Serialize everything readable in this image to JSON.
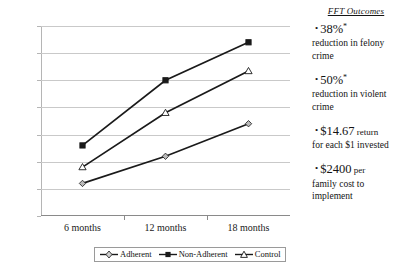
{
  "chart_data": {
    "type": "line",
    "title": "",
    "xlabel": "",
    "ylabel": "",
    "categories": [
      "6 months",
      "12 months",
      "18 months"
    ],
    "ylim": [
      0,
      35
    ],
    "ytick_labels": [
      "0.0%",
      "5.0%",
      "10.0%",
      "15.0%",
      "20.0%",
      "25.0%",
      "30.0%",
      "35.0%"
    ],
    "ytick_values": [
      0,
      5,
      10,
      15,
      20,
      25,
      30,
      35
    ],
    "grid": true,
    "legend_position": "bottom",
    "series": [
      {
        "name": "Adherent",
        "marker": "diamond",
        "values": [
          6.0,
          11.0,
          17.0
        ]
      },
      {
        "name": "Non-Adherent",
        "marker": "square",
        "values": [
          13.0,
          25.0,
          32.0
        ]
      },
      {
        "name": "Control",
        "marker": "triangle",
        "values": [
          9.0,
          19.0,
          26.7
        ]
      }
    ]
  },
  "legend": {
    "items": [
      {
        "label": "Adherent",
        "marker": "diamond-marker"
      },
      {
        "label": "Non-Adherent",
        "marker": "square-marker"
      },
      {
        "label": "Control",
        "marker": "triangle-marker"
      }
    ]
  },
  "outcomes": {
    "title": "FFT Outcomes",
    "items": [
      {
        "bullet": "•",
        "value": "38%",
        "sup": "*",
        "tail": "",
        "body": "reduction in felony crime"
      },
      {
        "bullet": "•",
        "value": "50%",
        "sup": "*",
        "tail": "",
        "body": "reduction in violent crime"
      },
      {
        "bullet": "•",
        "value": "$14.67",
        "sup": "",
        "tail": " return",
        "body": "for each $1 invested"
      },
      {
        "bullet": "•",
        "value": "$2400",
        "sup": "",
        "tail": " per",
        "body": "family cost to implement"
      }
    ]
  },
  "colors": {
    "line": "#1a1a1a",
    "grid": "#c9c9c9",
    "axis": "#8a8a8a",
    "text": "#141414",
    "marker_fill_open": "#ffffff",
    "marker_fill_solid": "#1a1a1a",
    "marker_fill_gray": "#b9b9b9"
  }
}
